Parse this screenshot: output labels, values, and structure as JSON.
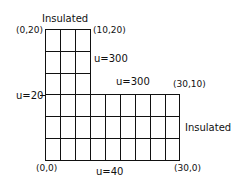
{
  "diagram": {
    "type": "L-shaped finite-difference grid",
    "labels": {
      "top_insulated": "Insulated",
      "right_insulated": "Insulated",
      "corner_top_left": "(0,20)",
      "corner_top_right": "(10,20)",
      "corner_mid_right": "(30,10)",
      "corner_bottom_left": "(0,0)",
      "corner_bottom_right": "(30,0)",
      "bc_upper_right": "u=300",
      "bc_step_top": "u=300",
      "bc_left": "u=20",
      "bc_bottom": "u=40"
    },
    "grid": {
      "upper_columns": 3,
      "upper_rows": 3,
      "lower_columns": 9,
      "lower_rows": 3,
      "line_color": "#111111"
    }
  }
}
